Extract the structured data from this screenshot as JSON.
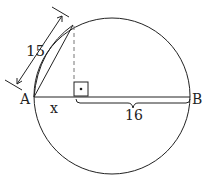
{
  "diagram": {
    "labels": {
      "point_a": "A",
      "point_b": "B",
      "segment_x": "x",
      "chord_length": "15",
      "segment_length": "16"
    },
    "colors": {
      "stroke": "#222222",
      "dashed": "#777777"
    }
  }
}
